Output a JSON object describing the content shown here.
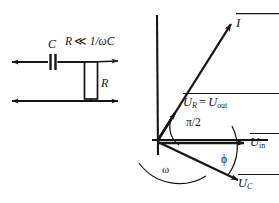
{
  "figure": {
    "ink_color": "#161616",
    "background": "#ffffff"
  },
  "circuit": {
    "name": "rc-high-pass-filter",
    "capacitor_label": "C",
    "resistor_label": "R",
    "condition_label": "R << 1/ωC",
    "condition_parts": {
      "resistor": "R",
      "relation": "≪",
      "expression": "1/ωC"
    },
    "terminals": {
      "input_left": "input terminal",
      "output_right": "output terminal",
      "ground_bottom": "ground rail"
    }
  },
  "phasor": {
    "name": "phasor-diagram",
    "axes": {
      "vertical": "vertical-axis",
      "horizontal": "horizontal-axis"
    },
    "vectors": [
      {
        "id": "current",
        "label": "I",
        "sub": "",
        "arrow": true
      },
      {
        "id": "u-r",
        "label": "U",
        "sub": "R",
        "arrow": true
      },
      {
        "id": "u-out",
        "label": "U",
        "sub": "out",
        "arrow": true
      },
      {
        "id": "u-in",
        "label": "U",
        "sub": "in",
        "arrow": true
      },
      {
        "id": "u-c",
        "label": "U",
        "sub": "C",
        "arrow": true
      }
    ],
    "labels": {
      "current": "I",
      "u_r_equals_u_out": "U_R = U_out",
      "equals_sign": "=",
      "u_r_base": "U",
      "u_r_sub": "R",
      "u_out_base": "U",
      "u_out_sub": "out",
      "u_in_base": "U",
      "u_in_sub": "in",
      "u_c_base": "U",
      "u_c_sub": "C",
      "right_angle": "π/2",
      "omega": "ω",
      "phi": "ϕ"
    },
    "angles": {
      "between_uc_and_ur": "π/2",
      "phase_angle": "ϕ",
      "rotation_direction": "ω"
    }
  }
}
